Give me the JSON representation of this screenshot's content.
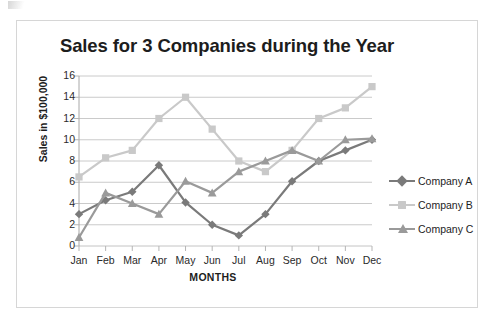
{
  "artifact": {
    "name": "scan-artifact"
  },
  "chart_data": {
    "type": "line",
    "title": "Sales for 3 Companies during the Year",
    "xlabel": "MONTHS",
    "ylabel": "Sales in $100,000",
    "categories": [
      "Jan",
      "Feb",
      "Mar",
      "Apr",
      "May",
      "Jun",
      "Jul",
      "Aug",
      "Sep",
      "Oct",
      "Nov",
      "Dec"
    ],
    "ylim": [
      0,
      16
    ],
    "ytick_step": 2,
    "yticks": [
      16,
      14,
      12,
      10,
      8,
      6,
      4,
      2,
      0
    ],
    "grid": true,
    "legend_position": "right",
    "series": [
      {
        "name": "Company A",
        "color": "#7a7a7a",
        "marker": "diamond",
        "values": [
          3,
          4.3,
          5.1,
          7.6,
          4.1,
          2,
          1,
          3,
          6.1,
          8,
          9,
          10
        ]
      },
      {
        "name": "Company B",
        "color": "#c9c9c9",
        "marker": "square",
        "values": [
          6.5,
          8.3,
          9,
          12,
          14,
          11,
          8,
          7,
          9,
          12,
          13,
          15
        ]
      },
      {
        "name": "Company C",
        "color": "#9a9a9a",
        "marker": "triangle",
        "values": [
          0.8,
          5,
          4,
          3,
          6.1,
          5,
          7,
          8,
          9,
          8,
          10,
          10.1
        ]
      }
    ]
  }
}
